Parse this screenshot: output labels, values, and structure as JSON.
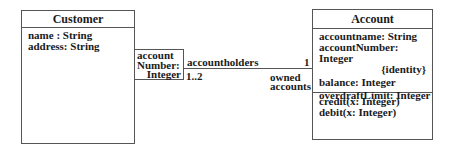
{
  "diagram": {
    "type": "UML class diagram",
    "customer": {
      "name": "Customer",
      "attributes": [
        "name : String",
        "address: String"
      ]
    },
    "qualifier": {
      "lines": [
        "account",
        "Number:",
        "Integer"
      ]
    },
    "association": {
      "name": "accountholders",
      "customer_end_multiplicity": "1..2",
      "account_end_multiplicity": "1",
      "account_end_role": [
        "owned",
        "accounts"
      ]
    },
    "account": {
      "name": "Account",
      "attributes": [
        "accountname: String",
        "accountNumber: Integer",
        "{identity}",
        "balance: Integer",
        "overdraftLimit: Integer"
      ],
      "operations": [
        "credit(x: Integer)",
        "debit(x: Integer)"
      ]
    }
  }
}
